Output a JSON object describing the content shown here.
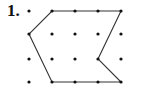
{
  "problem": {
    "number_label": "1.",
    "grid": {
      "cols": 5,
      "rows": 4,
      "x_positions": [
        29,
        52,
        75,
        98,
        121
      ],
      "y_positions": [
        11,
        34,
        59,
        82
      ],
      "dot_color": "#111111"
    },
    "polygon": {
      "vertices": [
        [
          1,
          0
        ],
        [
          4,
          0
        ],
        [
          3,
          2
        ],
        [
          4,
          3
        ],
        [
          1,
          3
        ],
        [
          0,
          1
        ]
      ],
      "stroke_color": "#333333"
    }
  }
}
